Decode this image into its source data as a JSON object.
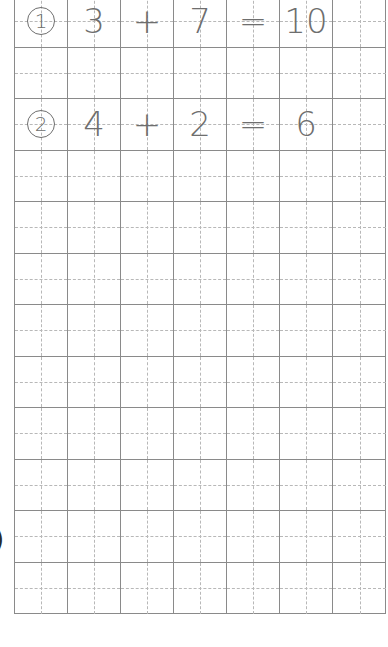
{
  "worksheet": {
    "type": "grid paper with math equations",
    "columns": 7,
    "rows": 12,
    "line_color": "#8a8a8a",
    "guide_color": "#b8b8b8",
    "text_color": "#6e6e6e",
    "problems": [
      {
        "row": 0,
        "number": "1",
        "cells": [
          "3",
          "+",
          "7",
          "=",
          "10",
          ""
        ]
      },
      {
        "row": 2,
        "number": "2",
        "cells": [
          "4",
          "+",
          "2",
          "=",
          "6",
          ""
        ]
      }
    ],
    "margin_mark": ")"
  }
}
